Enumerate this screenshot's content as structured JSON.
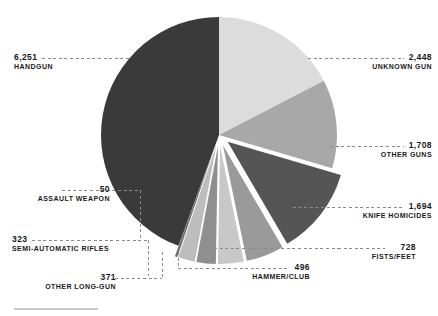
{
  "chart_data": {
    "type": "pie",
    "title": "",
    "subtitle": "",
    "xlabel": "",
    "ylabel": "",
    "legend_position": "callouts",
    "grid": false,
    "total": 14069,
    "categories": [
      "HANDGUN",
      "UNKNOWN GUN",
      "OTHER GUNS",
      "KNIFE HOMICIDES",
      "FISTS/FEET",
      "HAMMER/CLUB",
      "OTHER LONG-GUN",
      "SEMI-AUTOMATIC RIFLES",
      "ASSAULT WEAPON"
    ],
    "values": [
      6251,
      2448,
      1708,
      1694,
      728,
      496,
      371,
      323,
      50
    ],
    "value_labels": [
      "6,251",
      "2,448",
      "1,708",
      "1,694",
      "728",
      "496",
      "371",
      "323",
      "50"
    ],
    "colors": [
      "#3a3a3a",
      "#dcdcdc",
      "#a8a8a8",
      "#555555",
      "#9a9a9a",
      "#c8c8c8",
      "#8f8f8f",
      "#bdbdbd",
      "#707070"
    ],
    "exploded": [
      false,
      false,
      false,
      true,
      true,
      true,
      true,
      true,
      true
    ]
  },
  "slices": [
    {
      "id": "handgun",
      "label": "HANDGUN",
      "value_label": "6,251",
      "value": 6251,
      "color": "#3a3a3a"
    },
    {
      "id": "unknown-gun",
      "label": "UNKNOWN GUN",
      "value_label": "2,448",
      "value": 2448,
      "color": "#dcdcdc"
    },
    {
      "id": "other-guns",
      "label": "OTHER GUNS",
      "value_label": "1,708",
      "value": 1708,
      "color": "#a8a8a8"
    },
    {
      "id": "knife",
      "label": "KNIFE HOMICIDES",
      "value_label": "1,694",
      "value": 1694,
      "color": "#555555"
    },
    {
      "id": "fists-feet",
      "label": "FISTS/FEET",
      "value_label": "728",
      "value": 728,
      "color": "#9a9a9a"
    },
    {
      "id": "hammer-club",
      "label": "HAMMER/CLUB",
      "value_label": "496",
      "value": 496,
      "color": "#c8c8c8"
    },
    {
      "id": "other-long-gun",
      "label": "OTHER LONG-GUN",
      "value_label": "371",
      "value": 371,
      "color": "#8f8f8f"
    },
    {
      "id": "semi-auto",
      "label": "SEMI-AUTOMATIC RIFLES",
      "value_label": "323",
      "value": 323,
      "color": "#bdbdbd"
    },
    {
      "id": "assault-weapon",
      "label": "ASSAULT WEAPON",
      "value_label": "50",
      "value": 50,
      "color": "#707070"
    }
  ]
}
